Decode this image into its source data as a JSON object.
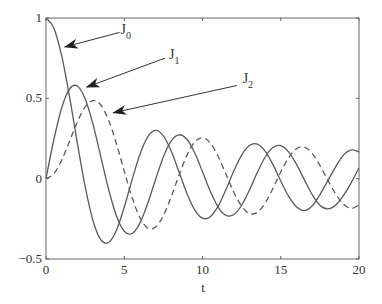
{
  "chart_data": {
    "type": "line",
    "title": "",
    "xlabel": "t",
    "ylabel": "",
    "xlim": [
      0,
      20
    ],
    "ylim": [
      -0.5,
      1
    ],
    "grid": false,
    "legend": "none (curves identified by arrow annotations)",
    "xticks": [
      0,
      5,
      10,
      15,
      20
    ],
    "xtick_labels": [
      "0",
      "5",
      "10",
      "15",
      "20"
    ],
    "yticks": [
      -0.5,
      0,
      0.5,
      1
    ],
    "ytick_labels": [
      "−0.5",
      "0",
      "0.5",
      "1"
    ],
    "x": [
      0,
      0.5,
      1,
      1.5,
      2,
      2.5,
      3,
      3.5,
      4,
      4.5,
      5,
      5.5,
      6,
      6.5,
      7,
      7.5,
      8,
      8.5,
      9,
      9.5,
      10,
      10.5,
      11,
      11.5,
      12,
      12.5,
      13,
      13.5,
      14,
      14.5,
      15,
      15.5,
      16,
      16.5,
      17,
      17.5,
      18,
      18.5,
      19,
      19.5,
      20
    ],
    "series": [
      {
        "name": "J0",
        "label_main": "J",
        "label_sub": "0",
        "style": "solid",
        "color": "#5a5a5a",
        "values": [
          1,
          0.9385,
          0.7652,
          0.5118,
          0.2239,
          -0.0484,
          -0.2601,
          -0.3801,
          -0.3971,
          -0.3205,
          -0.1776,
          -0.0068,
          0.1506,
          0.2601,
          0.3001,
          0.2663,
          0.1717,
          0.0419,
          -0.0903,
          -0.1939,
          -0.2459,
          -0.2366,
          -0.1712,
          -0.0677,
          0.0477,
          0.1469,
          0.2069,
          0.215,
          0.1711,
          0.0875,
          -0.0142,
          -0.1092,
          -0.1749,
          -0.1987,
          -0.1699,
          -0.1,
          -0.0134,
          0.0722,
          0.1466,
          0.1788,
          0.167
        ]
      },
      {
        "name": "J1",
        "label_main": "J",
        "label_sub": "1",
        "style": "solid",
        "color": "#5a5a5a",
        "values": [
          0,
          0.2423,
          0.4401,
          0.5579,
          0.5767,
          0.4971,
          0.3391,
          0.1374,
          -0.066,
          -0.2311,
          -0.3276,
          -0.3414,
          -0.2767,
          -0.1538,
          -0.0047,
          0.1352,
          0.2346,
          0.2731,
          0.2453,
          0.1613,
          0.0435,
          -0.0789,
          -0.1768,
          -0.2284,
          -0.2234,
          -0.1655,
          -0.0703,
          0.038,
          0.1334,
          0.1934,
          0.2051,
          0.1672,
          0.0904,
          -0.0047,
          -0.0977,
          -0.165,
          -0.188,
          -0.1658,
          -0.1057,
          -0.0263,
          0.0668
        ]
      },
      {
        "name": "J2",
        "label_main": "J",
        "label_sub": "2",
        "style": "dashed",
        "color": "#5a5a5a",
        "values": [
          0,
          0.0306,
          0.1149,
          0.2321,
          0.3528,
          0.4461,
          0.4861,
          0.4586,
          0.3641,
          0.2178,
          0.0466,
          -0.1173,
          -0.2429,
          -0.3074,
          -0.3014,
          -0.2303,
          -0.113,
          0.0223,
          0.1448,
          0.2279,
          0.2546,
          0.2216,
          0.139,
          0.028,
          -0.0849,
          -0.1706,
          -0.2177,
          -0.2094,
          -0.152,
          -0.0609,
          0.0416,
          0.1296,
          0.1862,
          0.1965,
          0.1584,
          0.0827,
          -0.0075,
          -0.0931,
          -0.1577,
          -0.185,
          -0.163
        ]
      }
    ],
    "annotations": [
      {
        "text": "J0",
        "main": "J",
        "sub": "0",
        "arrow_from": [
          4.7,
          0.91
        ],
        "arrow_to": [
          1.2,
          0.82
        ],
        "label_at": [
          4.7,
          0.91
        ]
      },
      {
        "text": "J1",
        "main": "J",
        "sub": "1",
        "arrow_from": [
          7.6,
          0.75
        ],
        "arrow_to": [
          2.6,
          0.57
        ],
        "label_at": [
          7.8,
          0.76
        ]
      },
      {
        "text": "J2",
        "main": "J",
        "sub": "2",
        "arrow_from": [
          12.2,
          0.58
        ],
        "arrow_to": [
          4.3,
          0.41
        ],
        "label_at": [
          12.5,
          0.61
        ]
      }
    ]
  },
  "colors": {
    "axis": "#666666",
    "curve": "#5a5a5a",
    "arrow": "#333333",
    "background": "#ffffff"
  }
}
